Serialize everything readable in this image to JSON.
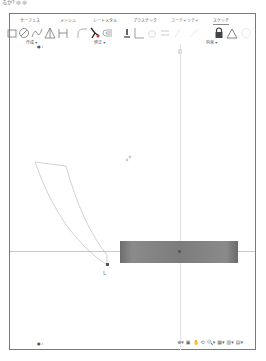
{
  "window": {
    "caption": "るか? ◎ ◎"
  },
  "tabs": [
    {
      "label": "サーフェス",
      "active": false
    },
    {
      "label": "メッシュ",
      "active": false
    },
    {
      "label": "シートメタル",
      "active": false
    },
    {
      "label": "プラスチック",
      "active": false
    },
    {
      "label": "ユーティリティ",
      "active": false
    },
    {
      "label": "スケッチ",
      "active": true
    }
  ],
  "toolbar": {
    "groups": [
      {
        "label": "作成 ▾"
      },
      {
        "label": "修正 ▾"
      },
      {
        "label": "拘束 ▾"
      }
    ],
    "tools": [
      "rectangle-icon",
      "circle-icon",
      "spline-icon",
      "triangle-icon",
      "slot-icon",
      "fillet-icon",
      "trim-icon",
      "offset-icon",
      "coincident-icon",
      "perpendicular-icon",
      "tangent-icon",
      "equal-icon",
      "lock-icon",
      "triangle-constraint-icon",
      "circle-constraint-icon"
    ]
  },
  "canvas": {
    "top_marker": "● ı",
    "bottom_marker": "● ı",
    "origin_label": "L"
  },
  "nav_bar": {
    "items": [
      "⊕▾",
      "▣",
      "✋",
      "⟲",
      "🔍▾",
      "▦▾",
      "▥▾",
      "▤▾"
    ]
  },
  "colors": {
    "frame_border": "#7a7a7a",
    "sketch_line": "#bbbbbb",
    "body_fill": "#7c7c7c",
    "axis": "#c8c8c8"
  }
}
